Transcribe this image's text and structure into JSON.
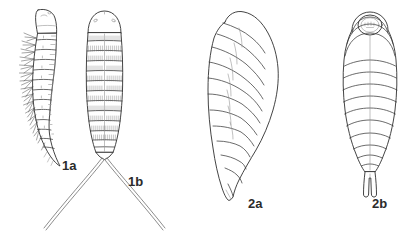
{
  "plate": {
    "title": "Insect larva line-drawing plate",
    "background_color": "#ffffff",
    "ink_color": "#2f2f2f",
    "width": 415,
    "height": 239,
    "panel_count": 4
  },
  "figures": [
    {
      "id": "1a",
      "label": "1a",
      "label_x": 62,
      "label_y": 170,
      "view": "lateral",
      "subject": "setose elongate larva",
      "description": "Elongate larva in lateral view with rounded head capsule, segmented abdomen and paired lateral setae along the ventral margin, body curving to a pointed posterior.",
      "segment_count": 11,
      "has_setae": true,
      "has_caudal_filaments": false
    },
    {
      "id": "1b",
      "label": "1b",
      "label_x": 128,
      "label_y": 186,
      "view": "dorsal",
      "subject": "setose elongate larva",
      "description": "Same larva in dorsal view showing dome-shaped head, bilaterally symmetric rows of dense fine setae on each segment, and two very long divergent caudal filaments forming a wide V.",
      "segment_count": 11,
      "has_setae": true,
      "has_caudal_filaments": true,
      "caudal_filament_count": 2
    },
    {
      "id": "2a",
      "label": "2a",
      "label_x": 248,
      "label_y": 208,
      "view": "lateral",
      "subject": "plump maggot-like larva",
      "description": "Stout maggot-like larva in lateral view, broadest across the anterior third, with prominent transverse segment folds and a body tapering to a narrow pointed posterior tip.",
      "segment_count": 11,
      "has_setae": false,
      "has_caudal_filaments": false
    },
    {
      "id": "2b",
      "label": "2b",
      "label_x": 372,
      "label_y": 208,
      "view": "dorsal",
      "subject": "plump maggot-like larva",
      "description": "Same stout larva in dorsal view, bilaterally symmetric, with a small circular head capsule at the anterior end, ten to eleven curved transverse segment bands and a short bifurcated posterior projection.",
      "segment_count": 11,
      "has_setae": false,
      "has_caudal_filaments": false,
      "has_circular_head_capsule": true
    }
  ]
}
